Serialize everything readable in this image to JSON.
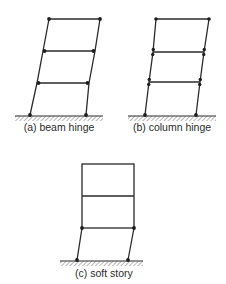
{
  "diagram": {
    "colors": {
      "line": "#2a2a2a",
      "node": "#1e1e1e",
      "background": "#ffffff"
    },
    "panels": [
      {
        "id": "a",
        "label": "(a) beam hinge",
        "mechanism": "beam-hinge",
        "stories": 3,
        "hinges": "beam ends and column bases"
      },
      {
        "id": "b",
        "label": "(b) column hinge",
        "mechanism": "column-hinge",
        "stories": 3,
        "hinges": "column ends at each floor and column bases"
      },
      {
        "id": "c",
        "label": "(c) soft story",
        "mechanism": "soft-story",
        "stories": 3,
        "hinges": "first-story column ends only"
      }
    ]
  }
}
